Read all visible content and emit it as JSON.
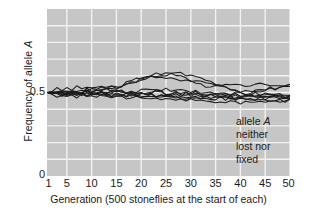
{
  "chart_data": {
    "type": "line",
    "title": "",
    "xlabel": "Generation (500 stoneflies at the start of each)",
    "ylabel": "Frequency of allele A",
    "ylabel_prefix": "Frequency of allele ",
    "ylabel_italic": "A",
    "xlim": [
      1,
      50
    ],
    "ylim": [
      0,
      1
    ],
    "grid": true,
    "legend": "none",
    "plot_background": "#c6c6c6",
    "gridline_color": "#f2f2f2",
    "line_color": "#1a1a1a",
    "xticks": [
      1,
      5,
      10,
      15,
      20,
      25,
      30,
      35,
      40,
      45,
      50
    ],
    "xtick_labels": [
      "1",
      "5",
      "10",
      "15",
      "20",
      "25",
      "30",
      "35",
      "40",
      "45",
      "50"
    ],
    "yticks": [
      0,
      0.5
    ],
    "ytick_labels": [
      "0",
      "0.5"
    ],
    "y_gridlines": [
      0.1,
      0.2,
      0.3,
      0.4,
      0.5,
      0.6,
      0.7,
      0.8,
      0.9
    ],
    "x": [
      1,
      2,
      3,
      4,
      5,
      6,
      7,
      8,
      9,
      10,
      11,
      12,
      13,
      14,
      15,
      16,
      17,
      18,
      19,
      20,
      21,
      22,
      23,
      24,
      25,
      26,
      27,
      28,
      29,
      30,
      31,
      32,
      33,
      34,
      35,
      36,
      37,
      38,
      39,
      40,
      41,
      42,
      43,
      44,
      45,
      46,
      47,
      48,
      49,
      50
    ],
    "series": [
      {
        "name": "population-1",
        "values": [
          0.5,
          0.512,
          0.52,
          0.514,
          0.526,
          0.518,
          0.53,
          0.524,
          0.534,
          0.528,
          0.522,
          0.532,
          0.526,
          0.536,
          0.53,
          0.542,
          0.556,
          0.566,
          0.578,
          0.588,
          0.596,
          0.604,
          0.61,
          0.604,
          0.612,
          0.618,
          0.622,
          0.616,
          0.608,
          0.6,
          0.596,
          0.588,
          0.578,
          0.566,
          0.558,
          0.548,
          0.538,
          0.526,
          0.516,
          0.508,
          0.502,
          0.498,
          0.504,
          0.51,
          0.518,
          0.526,
          0.522,
          0.53,
          0.536,
          0.54
        ]
      },
      {
        "name": "population-2",
        "values": [
          0.5,
          0.506,
          0.498,
          0.51,
          0.502,
          0.514,
          0.506,
          0.518,
          0.512,
          0.524,
          0.518,
          0.528,
          0.522,
          0.534,
          0.528,
          0.54,
          0.552,
          0.562,
          0.572,
          0.582,
          0.59,
          0.598,
          0.592,
          0.598,
          0.592,
          0.586,
          0.58,
          0.572,
          0.566,
          0.56,
          0.554,
          0.548,
          0.542,
          0.54,
          0.544,
          0.548,
          0.546,
          0.55,
          0.546,
          0.55,
          0.546,
          0.55,
          0.546,
          0.548,
          0.544,
          0.548,
          0.546,
          0.55,
          0.548,
          0.548
        ]
      },
      {
        "name": "population-3",
        "values": [
          0.5,
          0.494,
          0.504,
          0.496,
          0.508,
          0.5,
          0.512,
          0.504,
          0.516,
          0.508,
          0.52,
          0.512,
          0.524,
          0.516,
          0.528,
          0.534,
          0.546,
          0.556,
          0.568,
          0.578,
          0.588,
          0.594,
          0.586,
          0.594,
          0.6,
          0.606,
          0.598,
          0.59,
          0.582,
          0.574,
          0.568,
          0.56,
          0.554,
          0.548,
          0.54,
          0.532,
          0.524,
          0.514,
          0.506,
          0.5,
          0.494,
          0.5,
          0.508,
          0.516,
          0.522,
          0.53,
          0.524,
          0.532,
          0.538,
          0.54
        ]
      },
      {
        "name": "population-4",
        "values": [
          0.5,
          0.49,
          0.498,
          0.488,
          0.496,
          0.486,
          0.494,
          0.5,
          0.492,
          0.5,
          0.494,
          0.502,
          0.496,
          0.504,
          0.498,
          0.506,
          0.5,
          0.508,
          0.502,
          0.51,
          0.516,
          0.51,
          0.518,
          0.512,
          0.52,
          0.514,
          0.508,
          0.516,
          0.51,
          0.504,
          0.51,
          0.504,
          0.5,
          0.506,
          0.5,
          0.496,
          0.502,
          0.496,
          0.492,
          0.498,
          0.492,
          0.486,
          0.492,
          0.486,
          0.492,
          0.486,
          0.492,
          0.486,
          0.48,
          0.486
        ]
      },
      {
        "name": "population-5",
        "values": [
          0.5,
          0.488,
          0.48,
          0.488,
          0.478,
          0.486,
          0.476,
          0.484,
          0.474,
          0.482,
          0.476,
          0.484,
          0.478,
          0.486,
          0.48,
          0.486,
          0.492,
          0.486,
          0.494,
          0.5,
          0.494,
          0.502,
          0.508,
          0.502,
          0.496,
          0.49,
          0.498,
          0.492,
          0.486,
          0.492,
          0.486,
          0.48,
          0.486,
          0.48,
          0.474,
          0.48,
          0.474,
          0.468,
          0.474,
          0.468,
          0.462,
          0.468,
          0.462,
          0.468,
          0.462,
          0.468,
          0.474,
          0.468,
          0.462,
          0.468
        ]
      },
      {
        "name": "population-6",
        "values": [
          0.5,
          0.496,
          0.486,
          0.494,
          0.484,
          0.492,
          0.482,
          0.49,
          0.482,
          0.49,
          0.484,
          0.476,
          0.484,
          0.476,
          0.484,
          0.478,
          0.47,
          0.478,
          0.472,
          0.48,
          0.474,
          0.482,
          0.476,
          0.484,
          0.478,
          0.47,
          0.476,
          0.468,
          0.474,
          0.466,
          0.472,
          0.464,
          0.47,
          0.462,
          0.468,
          0.46,
          0.466,
          0.458,
          0.464,
          0.456,
          0.462,
          0.456,
          0.462,
          0.456,
          0.45,
          0.456,
          0.45,
          0.456,
          0.45,
          0.456
        ]
      },
      {
        "name": "population-7",
        "values": [
          0.5,
          0.504,
          0.494,
          0.502,
          0.492,
          0.5,
          0.49,
          0.498,
          0.488,
          0.496,
          0.488,
          0.496,
          0.488,
          0.48,
          0.488,
          0.48,
          0.472,
          0.48,
          0.472,
          0.464,
          0.472,
          0.464,
          0.456,
          0.464,
          0.458,
          0.45,
          0.458,
          0.464,
          0.458,
          0.452,
          0.446,
          0.452,
          0.446,
          0.452,
          0.446,
          0.44,
          0.446,
          0.44,
          0.446,
          0.44,
          0.446,
          0.44,
          0.446,
          0.452,
          0.446,
          0.452,
          0.446,
          0.452,
          0.446,
          0.452
        ]
      },
      {
        "name": "population-8",
        "values": [
          0.5,
          0.508,
          0.5,
          0.492,
          0.5,
          0.492,
          0.5,
          0.494,
          0.502,
          0.494,
          0.502,
          0.494,
          0.486,
          0.494,
          0.486,
          0.494,
          0.488,
          0.496,
          0.49,
          0.498,
          0.492,
          0.5,
          0.508,
          0.5,
          0.494,
          0.486,
          0.494,
          0.486,
          0.492,
          0.484,
          0.49,
          0.482,
          0.488,
          0.48,
          0.486,
          0.478,
          0.484,
          0.476,
          0.482,
          0.474,
          0.48,
          0.474,
          0.48,
          0.474,
          0.48,
          0.486,
          0.48,
          0.486,
          0.492,
          0.488
        ]
      },
      {
        "name": "population-9",
        "values": [
          0.5,
          0.492,
          0.502,
          0.496,
          0.506,
          0.498,
          0.508,
          0.5,
          0.51,
          0.502,
          0.512,
          0.504,
          0.514,
          0.506,
          0.516,
          0.508,
          0.498,
          0.506,
          0.498,
          0.49,
          0.498,
          0.49,
          0.482,
          0.49,
          0.482,
          0.49,
          0.498,
          0.49,
          0.498,
          0.492,
          0.5,
          0.494,
          0.486,
          0.492,
          0.486,
          0.494,
          0.486,
          0.478,
          0.486,
          0.48,
          0.474,
          0.48,
          0.474,
          0.468,
          0.476,
          0.47,
          0.478,
          0.472,
          0.466,
          0.472
        ]
      },
      {
        "name": "population-10",
        "values": [
          0.5,
          0.498,
          0.508,
          0.502,
          0.494,
          0.502,
          0.496,
          0.488,
          0.496,
          0.49,
          0.498,
          0.492,
          0.5,
          0.494,
          0.502,
          0.496,
          0.488,
          0.496,
          0.488,
          0.48,
          0.472,
          0.48,
          0.472,
          0.464,
          0.472,
          0.466,
          0.474,
          0.466,
          0.458,
          0.466,
          0.46,
          0.468,
          0.46,
          0.468,
          0.462,
          0.47,
          0.462,
          0.47,
          0.464,
          0.472,
          0.466,
          0.474,
          0.468,
          0.476,
          0.47,
          0.478,
          0.472,
          0.48,
          0.474,
          0.48
        ]
      }
    ],
    "annotation": {
      "line1_prefix": "allele ",
      "line1_italic": "A",
      "line2": "neither",
      "line3": "lost nor",
      "line4": "fixed"
    }
  }
}
